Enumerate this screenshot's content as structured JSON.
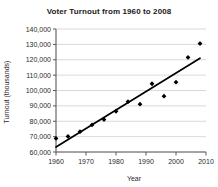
{
  "chart_data": {
    "type": "scatter",
    "title": "Voter Turnout from 1960 to 2008",
    "xlabel": "Year",
    "ylabel": "Turnout (thousands)",
    "xlim": [
      1960,
      2010
    ],
    "ylim": [
      60000,
      140000
    ],
    "xticks": [
      1960,
      1970,
      1980,
      1990,
      2000,
      2010
    ],
    "xtick_labels": [
      "1960",
      "1970",
      "1980",
      "1990",
      "2000",
      "2010"
    ],
    "yticks": [
      60000,
      70000,
      80000,
      90000,
      100000,
      110000,
      120000,
      130000,
      140000
    ],
    "ytick_labels": [
      "60,000",
      "70,000",
      "80,000",
      "90,000",
      "100,000",
      "110,000",
      "120,000",
      "130,000",
      "140,000"
    ],
    "grid": "horizontal",
    "legend": "none",
    "marker": "diamond",
    "x": [
      1960,
      1964,
      1968,
      1972,
      1976,
      1980,
      1984,
      1988,
      1992,
      1996,
      2000,
      2004,
      2008
    ],
    "y": [
      68800,
      70100,
      73200,
      77600,
      81100,
      86500,
      92700,
      91100,
      104400,
      96300,
      105400,
      121500,
      130500
    ],
    "series": [
      {
        "name": "Voter turnout",
        "values": [
          68800,
          70100,
          73200,
          77600,
          81100,
          86500,
          92700,
          91100,
          104400,
          96300,
          105400,
          121500,
          130500
        ]
      }
    ],
    "trendline": {
      "type": "linear",
      "x_start": 1960,
      "y_start": 63200,
      "x_end": 2008,
      "y_end": 121000
    },
    "colors": {
      "marker": "#000000",
      "trendline": "#000000",
      "gridline": "#c9c9c9",
      "axis": "#5a5a5a",
      "background": "#ffffff",
      "text": "#2b2b2b"
    }
  }
}
